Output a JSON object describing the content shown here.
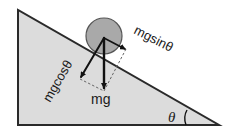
{
  "diagram": {
    "labels": {
      "weight": "mg",
      "parallel_component": "mgsinθ",
      "perpendicular_component": "mgcosθ",
      "angle": "θ"
    },
    "colors": {
      "incline_fill": "#dcdcdc",
      "incline_stroke": "#2a2a2a",
      "ball_fill": "#a9a9a9",
      "ball_stroke": "#555555",
      "vector": "#111111",
      "dashed": "#666666"
    }
  }
}
